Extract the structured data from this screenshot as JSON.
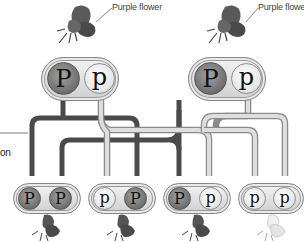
{
  "parents": [
    {
      "flower_label": "Purple flower",
      "flower_color": "purple",
      "alleles": [
        {
          "symbol": "P",
          "type": "dominant"
        },
        {
          "symbol": "p",
          "type": "recessive"
        }
      ]
    },
    {
      "flower_label": "Purple flower",
      "flower_color": "purple",
      "alleles": [
        {
          "symbol": "P",
          "type": "dominant"
        },
        {
          "symbol": "p",
          "type": "recessive"
        }
      ]
    }
  ],
  "offspring": [
    {
      "alleles": [
        {
          "symbol": "P",
          "type": "dominant"
        },
        {
          "symbol": "P",
          "type": "dominant"
        }
      ],
      "flower_color": "purple"
    },
    {
      "alleles": [
        {
          "symbol": "p",
          "type": "recessive"
        },
        {
          "symbol": "P",
          "type": "dominant"
        }
      ],
      "flower_color": "purple"
    },
    {
      "alleles": [
        {
          "symbol": "P",
          "type": "dominant"
        },
        {
          "symbol": "p",
          "type": "recessive"
        }
      ],
      "flower_color": "purple"
    },
    {
      "alleles": [
        {
          "symbol": "p",
          "type": "recessive"
        },
        {
          "symbol": "p",
          "type": "recessive"
        }
      ],
      "flower_color": "white"
    }
  ],
  "side_label_fragment": "on",
  "colors": {
    "dominant_pipe": "#4a4a4a",
    "recessive_pipe": "#d6d6d6",
    "recessive_pipe_outline": "#8a8a8a",
    "purple_flower": "#5b5b5b",
    "white_flower": "#ececec"
  }
}
